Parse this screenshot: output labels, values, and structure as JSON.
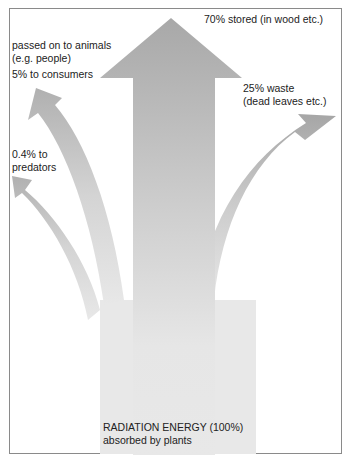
{
  "diagram": {
    "source": {
      "line1": "RADIATION ENERGY (100%)",
      "line2": "absorbed by plants"
    },
    "flows": [
      {
        "id": "stored",
        "label": "70% stored (in wood etc.)",
        "percent": 70
      },
      {
        "id": "waste",
        "label_line1": "25% waste",
        "label_line2": "(dead leaves etc.)",
        "percent": 25
      },
      {
        "id": "consumers",
        "header_line1": "passed on to animals",
        "header_line2": "(e.g. people)",
        "label": "5% to consumers",
        "percent": 5
      },
      {
        "id": "predators",
        "label_line1": "0.4% to",
        "label_line2": "predators",
        "percent": 0.4
      }
    ],
    "colors": {
      "frame": "#8a8a8a",
      "arrow_dark": "#a9a9a9",
      "arrow_light": "#e8e8e8",
      "text": "#222222"
    }
  }
}
